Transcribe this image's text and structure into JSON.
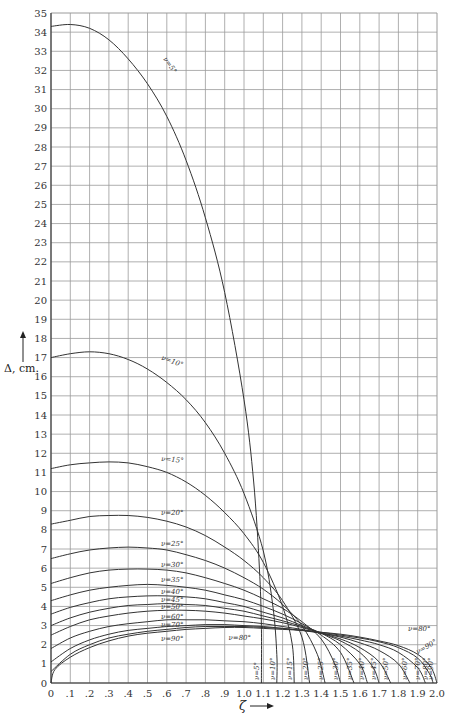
{
  "chart_data": {
    "type": "line",
    "title": "",
    "xlabel": "ζ",
    "ylabel": "Δ, cm.",
    "xlim": [
      0,
      2.0
    ],
    "ylim": [
      0,
      35
    ],
    "grid": true,
    "x_ticks": [
      "0",
      ".1",
      ".2",
      ".3",
      ".4",
      ".5",
      ".6",
      ".7",
      ".8",
      ".9",
      "1.0",
      "1.1",
      "1.2",
      "1.3",
      "1.4",
      "1.5",
      "1.6",
      "1.7",
      "1.8",
      "1.9",
      "2.0"
    ],
    "y_ticks": [
      "0",
      "1",
      "2",
      "3",
      "4",
      "5",
      "6",
      "7",
      "8",
      "9",
      "10",
      "11",
      "12",
      "13",
      "14",
      "15",
      "16",
      "17",
      "18",
      "19",
      "20",
      "21",
      "22",
      "23",
      "24",
      "25",
      "26",
      "27",
      "28",
      "29",
      "30",
      "31",
      "32",
      "33",
      "34",
      "35"
    ],
    "series": [
      {
        "name": "ν=5°",
        "points": [
          [
            0,
            34.3
          ],
          [
            0.1,
            34.4
          ],
          [
            0.2,
            34.2
          ],
          [
            0.3,
            33.6
          ],
          [
            0.4,
            32.6
          ],
          [
            0.5,
            31.3
          ],
          [
            0.6,
            29.6
          ],
          [
            0.7,
            27.3
          ],
          [
            0.8,
            24.3
          ],
          [
            0.9,
            20.4
          ],
          [
            1.0,
            14.8
          ],
          [
            1.05,
            10.5
          ],
          [
            1.08,
            6.0
          ],
          [
            1.09,
            3.0
          ],
          [
            1.09,
            0
          ]
        ]
      },
      {
        "name": "ν=10°",
        "points": [
          [
            0,
            17.0
          ],
          [
            0.1,
            17.2
          ],
          [
            0.2,
            17.3
          ],
          [
            0.3,
            17.2
          ],
          [
            0.4,
            16.9
          ],
          [
            0.5,
            16.4
          ],
          [
            0.6,
            15.7
          ],
          [
            0.7,
            14.8
          ],
          [
            0.8,
            13.6
          ],
          [
            0.9,
            12.0
          ],
          [
            1.0,
            9.9
          ],
          [
            1.1,
            6.9
          ],
          [
            1.15,
            4.0
          ],
          [
            1.17,
            1.5
          ],
          [
            1.17,
            0
          ]
        ]
      },
      {
        "name": "ν=15°",
        "points": [
          [
            0,
            11.2
          ],
          [
            0.1,
            11.4
          ],
          [
            0.2,
            11.5
          ],
          [
            0.3,
            11.55
          ],
          [
            0.4,
            11.5
          ],
          [
            0.5,
            11.3
          ],
          [
            0.6,
            11.0
          ],
          [
            0.7,
            10.5
          ],
          [
            0.8,
            9.8
          ],
          [
            0.9,
            8.9
          ],
          [
            1.0,
            7.8
          ],
          [
            1.1,
            6.3
          ],
          [
            1.2,
            4.0
          ],
          [
            1.25,
            2.0
          ],
          [
            1.26,
            0
          ]
        ]
      },
      {
        "name": "ν=20°",
        "points": [
          [
            0,
            8.3
          ],
          [
            0.1,
            8.5
          ],
          [
            0.2,
            8.7
          ],
          [
            0.3,
            8.75
          ],
          [
            0.4,
            8.75
          ],
          [
            0.5,
            8.65
          ],
          [
            0.6,
            8.45
          ],
          [
            0.7,
            8.15
          ],
          [
            0.8,
            7.7
          ],
          [
            0.9,
            7.1
          ],
          [
            1.0,
            6.4
          ],
          [
            1.1,
            5.5
          ],
          [
            1.2,
            4.3
          ],
          [
            1.3,
            2.4
          ],
          [
            1.34,
            0
          ]
        ]
      },
      {
        "name": "ν=25°",
        "points": [
          [
            0,
            6.5
          ],
          [
            0.1,
            6.75
          ],
          [
            0.2,
            6.95
          ],
          [
            0.3,
            7.05
          ],
          [
            0.4,
            7.1
          ],
          [
            0.5,
            7.05
          ],
          [
            0.6,
            6.95
          ],
          [
            0.7,
            6.7
          ],
          [
            0.8,
            6.4
          ],
          [
            0.9,
            6.0
          ],
          [
            1.0,
            5.5
          ],
          [
            1.1,
            4.9
          ],
          [
            1.2,
            4.1
          ],
          [
            1.3,
            3.0
          ],
          [
            1.38,
            1.5
          ],
          [
            1.42,
            0
          ]
        ]
      },
      {
        "name": "ν=30°",
        "points": [
          [
            0,
            5.2
          ],
          [
            0.1,
            5.5
          ],
          [
            0.2,
            5.75
          ],
          [
            0.3,
            5.9
          ],
          [
            0.4,
            5.95
          ],
          [
            0.5,
            5.95
          ],
          [
            0.6,
            5.9
          ],
          [
            0.7,
            5.75
          ],
          [
            0.8,
            5.5
          ],
          [
            0.9,
            5.2
          ],
          [
            1.0,
            4.85
          ],
          [
            1.1,
            4.4
          ],
          [
            1.2,
            3.9
          ],
          [
            1.3,
            3.2
          ],
          [
            1.4,
            2.3
          ],
          [
            1.47,
            1.0
          ],
          [
            1.5,
            0
          ]
        ]
      },
      {
        "name": "ν=35°",
        "points": [
          [
            0,
            4.3
          ],
          [
            0.1,
            4.6
          ],
          [
            0.2,
            4.85
          ],
          [
            0.3,
            5.0
          ],
          [
            0.4,
            5.1
          ],
          [
            0.5,
            5.15
          ],
          [
            0.6,
            5.1
          ],
          [
            0.7,
            5.0
          ],
          [
            0.8,
            4.85
          ],
          [
            0.9,
            4.6
          ],
          [
            1.0,
            4.35
          ],
          [
            1.1,
            4.0
          ],
          [
            1.2,
            3.6
          ],
          [
            1.3,
            3.1
          ],
          [
            1.4,
            2.5
          ],
          [
            1.5,
            1.6
          ],
          [
            1.57,
            0
          ]
        ]
      },
      {
        "name": "ν=40°",
        "points": [
          [
            0,
            3.6
          ],
          [
            0.1,
            3.95
          ],
          [
            0.2,
            4.2
          ],
          [
            0.3,
            4.4
          ],
          [
            0.4,
            4.5
          ],
          [
            0.5,
            4.55
          ],
          [
            0.6,
            4.55
          ],
          [
            0.7,
            4.5
          ],
          [
            0.8,
            4.4
          ],
          [
            0.9,
            4.2
          ],
          [
            1.0,
            4.0
          ],
          [
            1.1,
            3.7
          ],
          [
            1.2,
            3.4
          ],
          [
            1.3,
            3.0
          ],
          [
            1.4,
            2.6
          ],
          [
            1.5,
            2.0
          ],
          [
            1.6,
            1.0
          ],
          [
            1.64,
            0
          ]
        ]
      },
      {
        "name": "ν=45°",
        "points": [
          [
            0,
            3.0
          ],
          [
            0.1,
            3.4
          ],
          [
            0.2,
            3.7
          ],
          [
            0.3,
            3.9
          ],
          [
            0.4,
            4.05
          ],
          [
            0.5,
            4.1
          ],
          [
            0.6,
            4.15
          ],
          [
            0.7,
            4.1
          ],
          [
            0.8,
            4.05
          ],
          [
            0.9,
            3.9
          ],
          [
            1.0,
            3.75
          ],
          [
            1.1,
            3.5
          ],
          [
            1.2,
            3.25
          ],
          [
            1.3,
            2.95
          ],
          [
            1.4,
            2.6
          ],
          [
            1.5,
            2.2
          ],
          [
            1.6,
            1.6
          ],
          [
            1.67,
            0.8
          ],
          [
            1.7,
            0
          ]
        ]
      },
      {
        "name": "ν=50°",
        "points": [
          [
            0,
            2.5
          ],
          [
            0.1,
            2.95
          ],
          [
            0.2,
            3.3
          ],
          [
            0.3,
            3.5
          ],
          [
            0.4,
            3.65
          ],
          [
            0.5,
            3.75
          ],
          [
            0.6,
            3.8
          ],
          [
            0.7,
            3.8
          ],
          [
            0.8,
            3.75
          ],
          [
            0.9,
            3.65
          ],
          [
            1.0,
            3.5
          ],
          [
            1.1,
            3.35
          ],
          [
            1.2,
            3.15
          ],
          [
            1.3,
            2.9
          ],
          [
            1.4,
            2.6
          ],
          [
            1.5,
            2.3
          ],
          [
            1.6,
            1.85
          ],
          [
            1.7,
            1.1
          ],
          [
            1.76,
            0
          ]
        ]
      },
      {
        "name": "ν=60°",
        "points": [
          [
            0,
            1.8
          ],
          [
            0.1,
            2.35
          ],
          [
            0.2,
            2.7
          ],
          [
            0.3,
            2.95
          ],
          [
            0.4,
            3.1
          ],
          [
            0.5,
            3.2
          ],
          [
            0.6,
            3.3
          ],
          [
            0.7,
            3.3
          ],
          [
            0.8,
            3.3
          ],
          [
            0.9,
            3.25
          ],
          [
            1.0,
            3.2
          ],
          [
            1.1,
            3.1
          ],
          [
            1.2,
            2.95
          ],
          [
            1.3,
            2.8
          ],
          [
            1.4,
            2.6
          ],
          [
            1.5,
            2.4
          ],
          [
            1.6,
            2.1
          ],
          [
            1.7,
            1.7
          ],
          [
            1.8,
            1.0
          ],
          [
            1.86,
            0
          ]
        ]
      },
      {
        "name": "ν=70°",
        "points": [
          [
            0,
            1.1
          ],
          [
            0.1,
            1.8
          ],
          [
            0.2,
            2.25
          ],
          [
            0.3,
            2.55
          ],
          [
            0.4,
            2.75
          ],
          [
            0.5,
            2.85
          ],
          [
            0.6,
            2.95
          ],
          [
            0.7,
            3.0
          ],
          [
            0.8,
            3.05
          ],
          [
            0.9,
            3.05
          ],
          [
            1.0,
            3.0
          ],
          [
            1.1,
            2.95
          ],
          [
            1.2,
            2.85
          ],
          [
            1.3,
            2.75
          ],
          [
            1.4,
            2.6
          ],
          [
            1.5,
            2.45
          ],
          [
            1.6,
            2.25
          ],
          [
            1.7,
            2.0
          ],
          [
            1.8,
            1.6
          ],
          [
            1.9,
            0.8
          ],
          [
            1.94,
            0
          ]
        ]
      },
      {
        "name": "ν=80°",
        "points": [
          [
            0,
            0.6
          ],
          [
            0.1,
            1.5
          ],
          [
            0.2,
            2.0
          ],
          [
            0.3,
            2.35
          ],
          [
            0.4,
            2.55
          ],
          [
            0.5,
            2.7
          ],
          [
            0.6,
            2.8
          ],
          [
            0.7,
            2.9
          ],
          [
            0.8,
            2.95
          ],
          [
            0.9,
            2.95
          ],
          [
            1.0,
            2.95
          ],
          [
            1.1,
            2.9
          ],
          [
            1.2,
            2.85
          ],
          [
            1.3,
            2.75
          ],
          [
            1.4,
            2.65
          ],
          [
            1.5,
            2.5
          ],
          [
            1.6,
            2.35
          ],
          [
            1.7,
            2.15
          ],
          [
            1.8,
            1.85
          ],
          [
            1.9,
            1.3
          ],
          [
            1.96,
            0.5
          ],
          [
            1.98,
            0
          ]
        ]
      },
      {
        "name": "ν=90°",
        "points": [
          [
            0,
            0
          ],
          [
            0.02,
            0.7
          ],
          [
            0.1,
            1.35
          ],
          [
            0.2,
            1.85
          ],
          [
            0.3,
            2.2
          ],
          [
            0.4,
            2.45
          ],
          [
            0.5,
            2.6
          ],
          [
            0.6,
            2.7
          ],
          [
            0.7,
            2.8
          ],
          [
            0.8,
            2.85
          ],
          [
            0.9,
            2.9
          ],
          [
            1.0,
            2.9
          ],
          [
            1.1,
            2.85
          ],
          [
            1.2,
            2.8
          ],
          [
            1.3,
            2.75
          ],
          [
            1.4,
            2.65
          ],
          [
            1.5,
            2.55
          ],
          [
            1.6,
            2.4
          ],
          [
            1.7,
            2.2
          ],
          [
            1.8,
            1.95
          ],
          [
            1.9,
            1.5
          ],
          [
            1.97,
            0.8
          ],
          [
            2.0,
            0
          ]
        ]
      }
    ],
    "curve_labels_top": [
      {
        "text": "ν=5°",
        "x": 0.58,
        "y": 32.6,
        "rot": 55
      },
      {
        "text": "ν=10°",
        "x": 0.57,
        "y": 16.9,
        "rot": 20
      },
      {
        "text": "ν=15°",
        "x": 0.57,
        "y": 11.6,
        "rot": 5
      },
      {
        "text": "ν=20°",
        "x": 0.57,
        "y": 8.8,
        "rot": 0
      },
      {
        "text": "ν=25°",
        "x": 0.57,
        "y": 7.15,
        "rot": 0
      },
      {
        "text": "ν=30°",
        "x": 0.57,
        "y": 6.05,
        "rot": 0
      },
      {
        "text": "ν=35°",
        "x": 0.57,
        "y": 5.3,
        "rot": 0
      },
      {
        "text": "ν=40°",
        "x": 0.57,
        "y": 4.65,
        "rot": 0
      },
      {
        "text": "ν=45°",
        "x": 0.57,
        "y": 4.25,
        "rot": 0
      },
      {
        "text": "ν=50°",
        "x": 0.57,
        "y": 3.85,
        "rot": 0
      },
      {
        "text": "ν=60°",
        "x": 0.57,
        "y": 3.35,
        "rot": 0
      },
      {
        "text": "ν=70°",
        "x": 0.57,
        "y": 2.95,
        "rot": 0
      },
      {
        "text": "ν=90°",
        "x": 0.57,
        "y": 2.2,
        "rot": 0
      },
      {
        "text": "ν=80°",
        "x": 0.92,
        "y": 2.25,
        "rot": 0
      }
    ],
    "curve_labels_bottom": [
      "ν=5°",
      "ν=10°",
      "ν=15°",
      "ν=20°",
      "ν=25°",
      "ν=30°",
      "ν=35°",
      "ν=40°",
      "ν=45°",
      "ν=50°",
      "ν=60°",
      "ν=70°",
      "ν=80°",
      "ν=90°"
    ],
    "bottom_label_x": [
      1.1,
      1.18,
      1.27,
      1.35,
      1.43,
      1.51,
      1.58,
      1.645,
      1.705,
      1.765,
      1.865,
      1.935,
      1.975,
      2.0
    ],
    "right_labels": [
      {
        "text": "ν=80°",
        "x": 1.85,
        "y": 2.7,
        "rot": 0
      },
      {
        "text": "ν=90°",
        "x": 1.9,
        "y": 1.5,
        "rot": -30
      }
    ]
  }
}
